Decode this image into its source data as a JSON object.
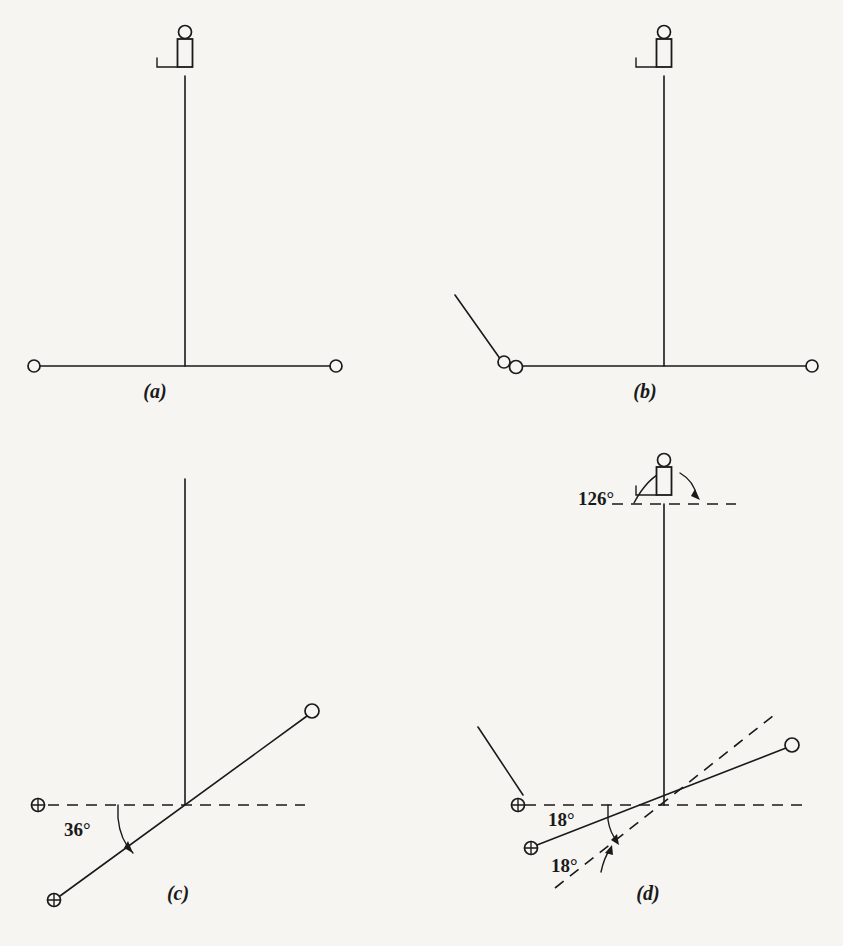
{
  "figure": {
    "background_color": "#f6f5f2",
    "ink_color": "#1a1a1a",
    "width": 843,
    "height": 946
  },
  "panels": [
    {
      "id": "a",
      "label": "(a)",
      "label_x": 155,
      "label_y": 392,
      "description": "Vertical mast with instrument at top and horizontal crossarm with two open-circle terminals",
      "angles": [],
      "markers": {
        "open_circles": 2,
        "crossed_circles": 0
      }
    },
    {
      "id": "b",
      "label": "(b)",
      "label_x": 645,
      "label_y": 392,
      "description": "Same mast with an added diagonal guy line ending at a pair of small circles near the left terminal",
      "angles": [],
      "markers": {
        "open_circles": 3,
        "crossed_circles": 0
      }
    },
    {
      "id": "c",
      "label": "(c)",
      "label_x": 178,
      "label_y": 893,
      "description": "Mast with crossarm rotated 36 degrees below the dashed horizontal reference",
      "angles": [
        {
          "value": "36°",
          "x": 64,
          "y": 828
        }
      ],
      "markers": {
        "open_circles": 1,
        "crossed_circles": 2
      }
    },
    {
      "id": "d",
      "label": "(d)",
      "label_x": 648,
      "label_y": 893,
      "description": "Mast with instrument rotated 126 degrees and crossarm at 18 degrees from each dashed reference",
      "angles": [
        {
          "value": "126°",
          "x": 601,
          "y": 498
        },
        {
          "value": "18°",
          "x": 556,
          "y": 818
        },
        {
          "value": "18°",
          "x": 558,
          "y": 852
        }
      ],
      "markers": {
        "open_circles": 1,
        "crossed_circles": 2
      }
    }
  ],
  "legend": {
    "open_circle_meaning": "open-circle-terminal",
    "crossed_circle_meaning": "crossed-circle-terminal",
    "dashed_line_meaning": "reference-axis",
    "instrument_symbol": "mast-head-instrument"
  }
}
